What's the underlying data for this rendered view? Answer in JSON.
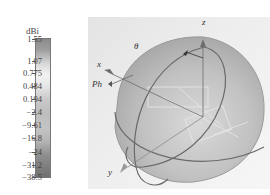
{
  "colorbar": {
    "unit": "dBi",
    "ticks": [
      {
        "label": "1.55",
        "y": 39
      },
      {
        "label": "1.07",
        "y": 61
      },
      {
        "label": "0.775",
        "y": 73
      },
      {
        "label": "0.484",
        "y": 86
      },
      {
        "label": "0.194",
        "y": 99
      },
      {
        "label": "−2.4",
        "y": 112
      },
      {
        "label": "−9.61",
        "y": 125
      },
      {
        "label": "−16.8",
        "y": 138
      },
      {
        "label": "−24",
        "y": 152
      },
      {
        "label": "−31.2",
        "y": 165
      },
      {
        "label": "−38.5",
        "y": 177
      }
    ],
    "max": 1.55,
    "min": -38.5
  },
  "pattern": {
    "axes": {
      "x": "x",
      "y": "y",
      "z": "z",
      "theta": "θ",
      "phi": "Ph"
    },
    "description": "3D far-field radiation pattern (grayscale) over antenna structure"
  }
}
